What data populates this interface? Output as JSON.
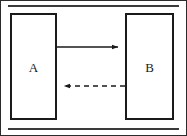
{
  "figure": {
    "type": "node-edge-diagram",
    "background_color": "#ffffff",
    "line_color": "#1a1a1a",
    "frame": {
      "name": "outer-border",
      "visible": true
    },
    "rules": [
      {
        "name": "top-rule",
        "position": "top"
      },
      {
        "name": "bottom-rule",
        "position": "bottom"
      }
    ],
    "nodes": [
      {
        "id": "a",
        "label": "A",
        "shape": "rectangle",
        "fill": "#ffffff",
        "stroke": "#1a1a1a"
      },
      {
        "id": "b",
        "label": "B",
        "shape": "rectangle",
        "fill": "#ffffff",
        "stroke": "#1a1a1a"
      }
    ],
    "edges": [
      {
        "id": "forward",
        "from": "A",
        "to": "B",
        "style": "solid",
        "direction": "right",
        "arrowhead": "filled-triangle",
        "label": ""
      },
      {
        "id": "backward",
        "from": "B",
        "to": "A",
        "style": "dashed",
        "direction": "left",
        "arrowhead": "filled-triangle",
        "label": ""
      }
    ]
  }
}
